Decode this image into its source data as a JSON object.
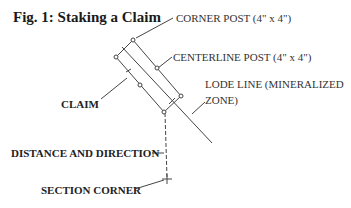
{
  "figure": {
    "title": "Fig. 1: Staking a Claim",
    "labels": {
      "corner_post": "CORNER POST (4\" x 4\")",
      "centerline_post": "CENTERLINE POST (4\" x 4\")",
      "lode_line_1": "LODE LINE (MINERALIZED",
      "lode_line_2": "ZONE)",
      "claim": "CLAIM",
      "distance_direction": "DISTANCE AND DIRECTION",
      "section_corner": "SECTION CORNER"
    }
  },
  "colors": {
    "line": "#444444",
    "text": "#222222",
    "background": "#ffffff"
  }
}
